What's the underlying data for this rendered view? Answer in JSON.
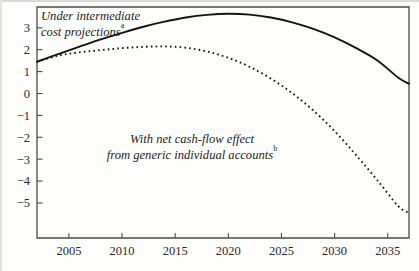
{
  "figure": {
    "name": "social-security-balance-projection",
    "background_color": "#fdfdfc",
    "ink_color": "#141414",
    "axis_color": "#4b4b4b"
  },
  "chart_data": {
    "type": "line",
    "title": "",
    "xlabel": "",
    "ylabel": "",
    "xlim": [
      2002,
      2037
    ],
    "ylim": [
      -6.6,
      3.95
    ],
    "grid": false,
    "legend_position": "inline-annotations",
    "xticks": [
      2005,
      2010,
      2015,
      2020,
      2025,
      2030,
      2035
    ],
    "xtick_labels": [
      "2005",
      "2010",
      "2015",
      "2020",
      "2025",
      "2030",
      "2035"
    ],
    "yticks": [
      3,
      2,
      1,
      0,
      -1,
      -2,
      -3,
      -4,
      -5
    ],
    "ytick_labels": [
      "3",
      "2",
      "1",
      "0",
      "−1",
      "−2",
      "−3",
      "−4",
      "−5"
    ],
    "x": [
      2002,
      2004,
      2006,
      2008,
      2010,
      2012,
      2014,
      2016,
      2018,
      2020,
      2022,
      2024,
      2026,
      2028,
      2030,
      2032,
      2034,
      2036,
      2037
    ],
    "series": [
      {
        "name": "Under intermediate cost projections",
        "style": "solid",
        "values": [
          1.45,
          1.8,
          2.14,
          2.47,
          2.77,
          3.05,
          3.28,
          3.47,
          3.59,
          3.64,
          3.6,
          3.47,
          3.25,
          2.95,
          2.56,
          2.08,
          1.52,
          0.72,
          0.45
        ]
      },
      {
        "name": "With net cash-flow effect from generic individual accounts",
        "style": "dotted",
        "values": [
          1.45,
          1.73,
          1.88,
          1.98,
          2.07,
          2.13,
          2.15,
          2.09,
          1.92,
          1.63,
          1.22,
          0.68,
          0.02,
          -0.78,
          -1.72,
          -2.8,
          -3.95,
          -5.15,
          -5.45
        ]
      }
    ],
    "annotations": [
      {
        "id": "annotation-intermediate",
        "lines": [
          "Under intermediate",
          "cost projections"
        ],
        "superscript": "a",
        "x_px": 41,
        "y_px": 20
      },
      {
        "id": "annotation-individual-accounts",
        "lines": [
          "With net cash-flow effect",
          "from generic individual accounts"
        ],
        "superscript": "b",
        "x_px": 192,
        "y_px": 143
      }
    ]
  }
}
